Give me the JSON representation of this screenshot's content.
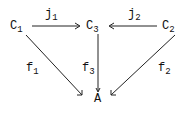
{
  "diagram": {
    "type": "commutative-diagram",
    "nodes": [
      {
        "id": "C1",
        "base": "C",
        "sub": "1"
      },
      {
        "id": "C3",
        "base": "C",
        "sub": "3"
      },
      {
        "id": "C2",
        "base": "C",
        "sub": "2"
      },
      {
        "id": "A",
        "base": "A",
        "sub": ""
      }
    ],
    "edges": [
      {
        "from": "C1",
        "to": "C3",
        "base": "j",
        "sub": "1"
      },
      {
        "from": "C2",
        "to": "C3",
        "base": "j",
        "sub": "2"
      },
      {
        "from": "C1",
        "to": "A",
        "base": "f",
        "sub": "1"
      },
      {
        "from": "C3",
        "to": "A",
        "base": "f",
        "sub": "3"
      },
      {
        "from": "C2",
        "to": "A",
        "base": "f",
        "sub": "2"
      }
    ],
    "colors": {
      "ink": "#111111",
      "background": "#ffffff"
    }
  }
}
